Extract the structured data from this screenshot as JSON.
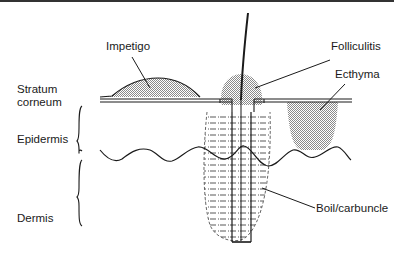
{
  "diagram": {
    "layers": {
      "stratum_corneum": "Stratum\ncorneum",
      "stratum_corneum_line1": "Stratum",
      "stratum_corneum_line2": "corneum",
      "epidermis": "Epidermis",
      "dermis": "Dermis"
    },
    "conditions": {
      "impetigo": "Impetigo",
      "folliculitis": "Folliculitis",
      "ecthyma": "Ecthyma",
      "boil": "Boil/carbuncle"
    },
    "colors": {
      "line": "#1a1a1a",
      "stipple": "#9a9a9a",
      "background": "#ffffff"
    }
  }
}
